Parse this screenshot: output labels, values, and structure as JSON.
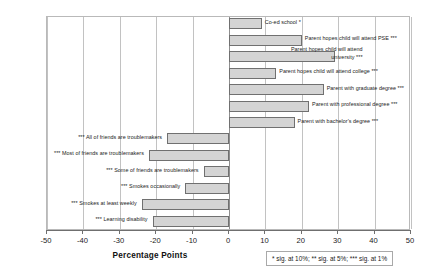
{
  "chart_data": {
    "type": "bar",
    "orientation": "horizontal",
    "title": "",
    "xlabel": "Percentage Points",
    "ylabel": "",
    "xlim": [
      -50,
      50
    ],
    "xticks": [
      -50,
      -40,
      -30,
      -20,
      -10,
      0,
      10,
      20,
      30,
      40,
      50
    ],
    "xtick_labels": [
      "-50",
      "-40",
      "-30",
      "-20",
      "-10",
      "0",
      "10",
      "20",
      "30",
      "40",
      "50"
    ],
    "grid": true,
    "legend": false,
    "annotation": "* sig. at 10%; ** sig. at 5%; *** sig. at 1%",
    "categories": [
      "Co-ed school *",
      "Parent hopes child will attend PSE ***",
      "Parent hopes child will attend university ***",
      "Parent hopes child will attend college ***",
      "Parent with graduate degree ***",
      "Parent with professional degree ***",
      "Parent with bachelor's degree ***",
      "*** All of friends are troublemakers",
      "*** Most of friends are troublemakers",
      "*** Some of friends are troublemakers",
      "*** Smokes occasionally",
      "*** Smokes at least weekly",
      "*** Learning disability"
    ],
    "values": [
      9,
      20,
      29,
      13,
      26,
      22,
      18,
      -17,
      -22,
      -7,
      -12,
      -24,
      -21
    ],
    "bars": [
      {
        "label": "Co-ed school *",
        "value": 9,
        "side": "right",
        "wrap": false
      },
      {
        "label": "Parent hopes child will attend PSE ***",
        "value": 20,
        "side": "right",
        "wrap": false
      },
      {
        "label": "Parent hopes child will attend university ***",
        "value": 29,
        "side": "right",
        "wrap": true
      },
      {
        "label": "Parent hopes child will attend college ***",
        "value": 13,
        "side": "right",
        "wrap": false
      },
      {
        "label": "Parent with graduate degree ***",
        "value": 26,
        "side": "right",
        "wrap": false
      },
      {
        "label": "Parent with professional degree ***",
        "value": 22,
        "side": "right",
        "wrap": false
      },
      {
        "label": "Parent with bachelor's degree ***",
        "value": 18,
        "side": "right",
        "wrap": false
      },
      {
        "label": "*** All of friends are troublemakers",
        "value": -17,
        "side": "left",
        "wrap": false
      },
      {
        "label": "*** Most of friends are troublemakers",
        "value": -22,
        "side": "left",
        "wrap": false
      },
      {
        "label": "*** Some of friends are troublemakers",
        "value": -7,
        "side": "left",
        "wrap": false
      },
      {
        "label": "*** Smokes occasionally",
        "value": -12,
        "side": "left",
        "wrap": false
      },
      {
        "label": "*** Smokes at least weekly",
        "value": -24,
        "side": "left",
        "wrap": false
      },
      {
        "label": "*** Learning disability",
        "value": -21,
        "side": "left",
        "wrap": false
      }
    ],
    "bar_fill_color": "#d4d4d4",
    "bar_border_color": "#707070",
    "gridline_color": "#c2c2c2",
    "plot_border_color": "#b9b9b9"
  }
}
